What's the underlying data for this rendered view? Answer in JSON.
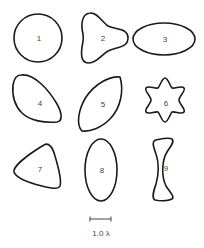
{
  "figure": {
    "shapes": [
      {
        "id": "1",
        "label": "1",
        "kind": "circle"
      },
      {
        "id": "2",
        "label": "2",
        "kind": "trefoil"
      },
      {
        "id": "3",
        "label": "3",
        "kind": "horizontal-ellipse"
      },
      {
        "id": "4",
        "label": "4",
        "kind": "teardrop"
      },
      {
        "id": "5",
        "label": "5",
        "kind": "leaf"
      },
      {
        "id": "6",
        "label": "6",
        "kind": "six-lobed-star"
      },
      {
        "id": "7",
        "label": "7",
        "kind": "rounded-triangle"
      },
      {
        "id": "8",
        "label": "8",
        "kind": "vertical-ellipse"
      },
      {
        "id": "9",
        "label": "9",
        "kind": "hourglass"
      }
    ],
    "scale_bar": {
      "label": "1.0 λ"
    },
    "colors": {
      "stroke": "#1a1a1a",
      "label": "#444444",
      "background": "#ffffff"
    }
  }
}
